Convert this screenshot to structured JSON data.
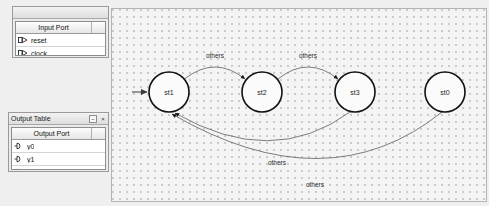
{
  "input_panel": {
    "window_title": "",
    "column_header": "Input Port",
    "ports": [
      {
        "name": "reset",
        "icon": "input-port-icon"
      },
      {
        "name": "clock",
        "icon": "input-port-icon"
      }
    ]
  },
  "output_panel": {
    "window_title": "Output Table",
    "minimize_label": "−",
    "close_label": "×",
    "column_header": "Output Port",
    "ports": [
      {
        "name": "y0",
        "icon": "output-port-icon"
      },
      {
        "name": "y1",
        "icon": "output-port-icon"
      },
      {
        "name": "y2",
        "icon": "output-port-icon"
      }
    ]
  },
  "diagram": {
    "states": [
      {
        "id": "st1",
        "label": "st1",
        "cx": 57,
        "cy": 83,
        "r": 20,
        "initial": true
      },
      {
        "id": "st2",
        "label": "st2",
        "cx": 150,
        "cy": 83,
        "r": 20,
        "initial": false
      },
      {
        "id": "st3",
        "label": "st3",
        "cx": 243,
        "cy": 83,
        "r": 20,
        "initial": false
      },
      {
        "id": "st0",
        "label": "st0",
        "cx": 333,
        "cy": 83,
        "r": 20,
        "initial": false
      }
    ],
    "transitions": [
      {
        "from": "st1",
        "to": "st2",
        "label": "others"
      },
      {
        "from": "st2",
        "to": "st3",
        "label": "others"
      },
      {
        "from": "st3",
        "to": "st1",
        "label": "others"
      },
      {
        "from": "st0",
        "to": "st1",
        "label": "others"
      }
    ]
  }
}
